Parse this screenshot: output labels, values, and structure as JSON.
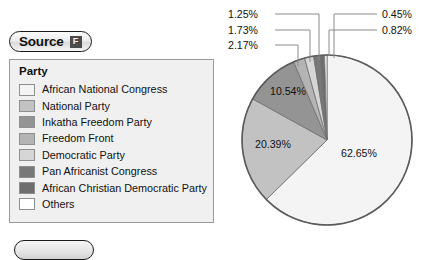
{
  "toolbar": {
    "source_label": "Source",
    "source_badge_glyph": "F"
  },
  "legend": {
    "title": "Party",
    "items": [
      {
        "label": "African National Congress",
        "color": "#f4f4f4"
      },
      {
        "label": "National Party",
        "color": "#c2c2c2"
      },
      {
        "label": "Inkatha Freedom Party",
        "color": "#949494"
      },
      {
        "label": "Freedom Front",
        "color": "#b4b4b4"
      },
      {
        "label": "Democratic Party",
        "color": "#d6d6d6"
      },
      {
        "label": "Pan Africanist Congress",
        "color": "#787878"
      },
      {
        "label": "African Christian Democratic Party",
        "color": "#6e6e6e"
      },
      {
        "label": "Others",
        "color": "#ffffff"
      }
    ]
  },
  "chart_data": {
    "type": "pie",
    "title": "",
    "legend_position": "left",
    "categories": [
      "African National Congress",
      "National Party",
      "Inkatha Freedom Party",
      "Freedom Front",
      "Democratic Party",
      "Pan Africanist Congress",
      "African Christian Democratic Party",
      "Others"
    ],
    "values": [
      62.65,
      20.39,
      10.54,
      2.17,
      1.73,
      1.25,
      0.82,
      0.45
    ],
    "labels": [
      "62.65%",
      "20.39%",
      "10.54%",
      "2.17%",
      "1.73%",
      "1.25%",
      "0.82%",
      "0.45%"
    ],
    "colors": [
      "#f4f4f4",
      "#c2c2c2",
      "#949494",
      "#b4b4b4",
      "#d6d6d6",
      "#787878",
      "#6e6e6e",
      "#ffffff"
    ],
    "units": "percent",
    "inside_labels": [
      "62.65%",
      "20.39%",
      "10.54%"
    ],
    "callout_labels_left": [
      "1.25%",
      "1.73%",
      "2.17%"
    ],
    "callout_labels_right": [
      "0.45%",
      "0.82%"
    ]
  },
  "callouts": {
    "l1": "1.25%",
    "l2": "1.73%",
    "l3": "2.17%",
    "r1": "0.45%",
    "r2": "0.82%"
  },
  "slice_labels": {
    "main": "62.65%",
    "second": "20.39%",
    "third": "10.54%"
  }
}
